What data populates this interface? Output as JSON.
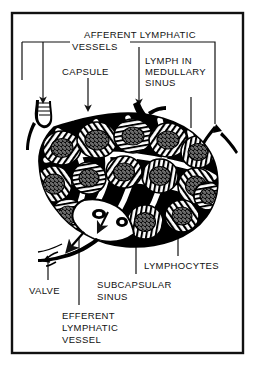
{
  "figure": {
    "frame": {
      "color": "#111111",
      "x": 12,
      "y": 13,
      "width": 231,
      "height": 340
    },
    "background": "#ffffff",
    "ink_color": "#000000"
  },
  "labels": [
    {
      "id": "afferent-lymphatic-vessels",
      "line1": "AFFERENT LYMPHATIC",
      "line2": "VESSELS",
      "x1": 84,
      "y1": 29,
      "x2": 72,
      "y2": 41
    },
    {
      "id": "capsule",
      "text": "CAPSULE",
      "x": 62,
      "y": 71
    },
    {
      "id": "lymph-in-medullary-sinus",
      "line1": "LYMPH IN",
      "line2": "MEDULLARY",
      "line3": "SINUS",
      "x": 139,
      "y": 60
    },
    {
      "id": "lymphocytes",
      "text": "LYMPHOCYTES",
      "x": 176,
      "y": 263
    },
    {
      "id": "valve",
      "text": "VALVE",
      "x": 29,
      "y": 286
    },
    {
      "id": "subcapsular-sinus",
      "line1": "SUBCAPSULAR",
      "line2": "SINUS",
      "x": 97,
      "y": 281
    },
    {
      "id": "efferent-lymphatic-vessel",
      "line1": "EFFERENT",
      "line2": "LYMPHATIC",
      "line3": "VESSEL",
      "x": 62,
      "y": 311
    }
  ],
  "structures": [
    {
      "id": "lymph-node-body",
      "name": "lymph node cortex and medulla"
    },
    {
      "id": "capsule-outline",
      "name": "capsule"
    },
    {
      "id": "hilum",
      "name": "hilum"
    },
    {
      "id": "afferent-vessel-left",
      "name": "afferent lymphatic vessel (left)"
    },
    {
      "id": "afferent-vessel-top",
      "name": "afferent lymphatic vessel (top)"
    },
    {
      "id": "afferent-vessel-right",
      "name": "afferent lymphatic vessel (right)"
    },
    {
      "id": "efferent-vessel",
      "name": "efferent lymphatic vessel with valve"
    }
  ]
}
